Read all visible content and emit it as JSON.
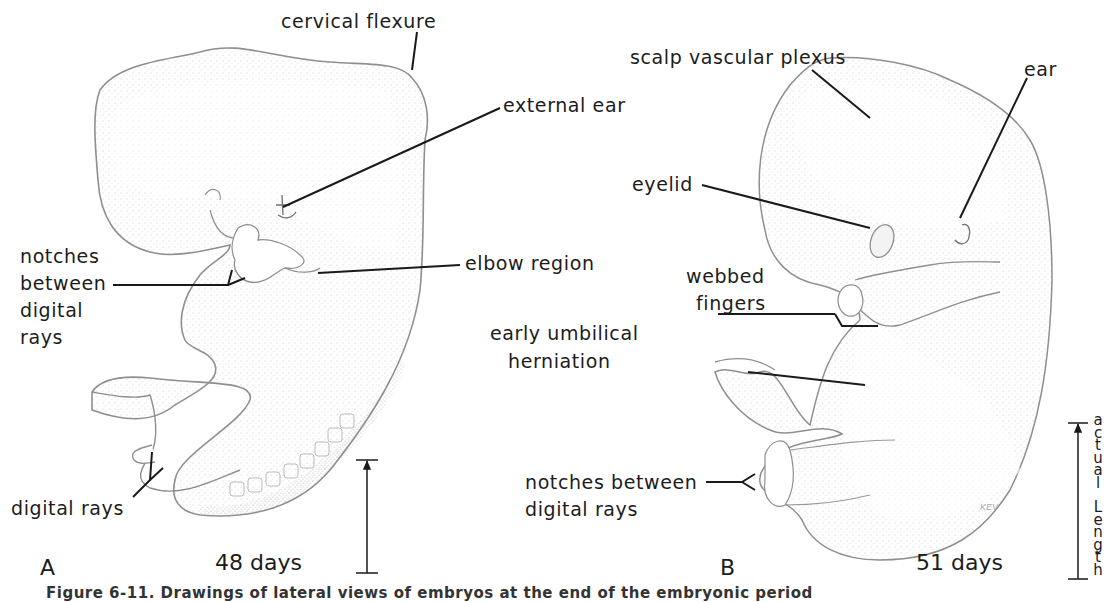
{
  "figure": {
    "caption": "Figure 6-11. Drawings of lateral views of embryos at the end of the embryonic period",
    "outline_color": "#8a8a8a",
    "stipple_color": "#b5b5b5",
    "line_color": "#1a1a1a"
  },
  "panel_a": {
    "letter": "A",
    "age": "48 days",
    "labels": {
      "cervical_flexure": "cervical flexure",
      "external_ear": "external ear",
      "notches": [
        "notches",
        "between",
        "digital",
        "rays"
      ],
      "elbow_region": "elbow region",
      "digital_rays": "digital rays"
    }
  },
  "panel_b": {
    "letter": "B",
    "age": "51 days",
    "artist_initials": "KEV",
    "labels": {
      "scalp_vascular_plexus": "scalp vascular plexus",
      "ear": "ear",
      "eyelid": "eyelid",
      "webbed_fingers": [
        "webbed",
        "fingers"
      ],
      "early_umbilical_herniation": [
        "early umbilical",
        "herniation"
      ],
      "notches_between_digital_rays": [
        "notches between",
        "digital rays"
      ]
    },
    "scale_label": [
      "a",
      "c",
      "t",
      "u",
      "a",
      "l",
      " ",
      "L",
      "e",
      "n",
      "g",
      "t",
      "h"
    ]
  }
}
